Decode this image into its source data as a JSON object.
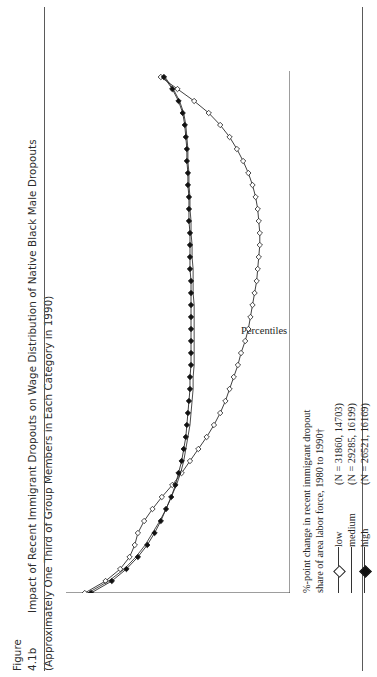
{
  "caption": {
    "figure_number": "Figure 4.1b",
    "line1": "Impact of Recent Immigrant Dropouts on Wage Distribution of Native Black Male Dropouts",
    "line2": "(Approximately One Third of Group Members in Each Category in 1990)"
  },
  "legend": {
    "header_line1": "%-point change in recent immigrant dropout",
    "header_line2": "share of area labor force, 1980 to 1990†",
    "entries": [
      {
        "label": "low",
        "n_text": "(N = 31860, 14703)",
        "marker": "open-diamond"
      },
      {
        "label": "medium",
        "n_text": "(N = 29285, 16199)",
        "marker": "line-only"
      },
      {
        "label": "high",
        "n_text": "(N = 26521, 16169)",
        "marker": "filled-diamond"
      }
    ]
  },
  "chart_data": {
    "type": "line",
    "title": "Impact of Recent Immigrant Dropouts on Wage Distribution of Native Black Male Dropouts",
    "xlabel": "Percentiles of distribution of wage residuals*",
    "ylabel": "Change in Log-Wage Residual, 1980 to 1990",
    "xlim": [
      5,
      92
    ],
    "ylim": [
      -0.15,
      0.065
    ],
    "grid": false,
    "legend_position": "below-right",
    "xticks": [
      10,
      15,
      20,
      25,
      30,
      35,
      40,
      45,
      50,
      55,
      60,
      65,
      70,
      75,
      80,
      85,
      90
    ],
    "xticklabels": [
      "10",
      "15",
      "20",
      "25",
      "30",
      "35",
      "40",
      "45",
      "50",
      "55",
      "60",
      "65",
      "70",
      "75",
      "80",
      "85",
      "90"
    ],
    "yticks": [
      0.06,
      0.04,
      0.02,
      0,
      -0.02,
      -0.04,
      -0.06,
      -0.08,
      -0.1,
      -0.12,
      -0.14
    ],
    "yticklabels": [
      "0.06",
      "0.04",
      "0.02",
      "0",
      "-0.02",
      "-0.04",
      "-0.06",
      "-0.08",
      "-0.1",
      "-0.12",
      "-0.14"
    ],
    "x": [
      5,
      7,
      9,
      11,
      13,
      15,
      17,
      19,
      21,
      23,
      25,
      27,
      29,
      31,
      33,
      35,
      37,
      39,
      41,
      43,
      45,
      47,
      49,
      51,
      53,
      55,
      57,
      59,
      61,
      63,
      65,
      67,
      69,
      71,
      73,
      75,
      77,
      79,
      81,
      83,
      85,
      87,
      89,
      91
    ],
    "series": [
      {
        "name": "low",
        "marker": "open-diamond",
        "values": [
          0.047,
          0.027,
          0.013,
          0.004,
          -0.001,
          -0.004,
          -0.01,
          -0.018,
          -0.027,
          -0.037,
          -0.046,
          -0.054,
          -0.062,
          -0.07,
          -0.077,
          -0.083,
          -0.088,
          -0.092,
          -0.096,
          -0.1,
          -0.103,
          -0.107,
          -0.11,
          -0.112,
          -0.114,
          -0.116,
          -0.118,
          -0.119,
          -0.12,
          -0.121,
          -0.121,
          -0.12,
          -0.119,
          -0.117,
          -0.114,
          -0.11,
          -0.105,
          -0.099,
          -0.092,
          -0.083,
          -0.072,
          -0.058,
          -0.042,
          -0.026
        ]
      },
      {
        "name": "medium",
        "marker": "line-only",
        "values": [
          0.044,
          0.024,
          0.009,
          -0.002,
          -0.011,
          -0.018,
          -0.025,
          -0.031,
          -0.036,
          -0.041,
          -0.045,
          -0.048,
          -0.05,
          -0.052,
          -0.054,
          -0.055,
          -0.056,
          -0.057,
          -0.057,
          -0.058,
          -0.058,
          -0.058,
          -0.058,
          -0.058,
          -0.058,
          -0.057,
          -0.057,
          -0.057,
          -0.056,
          -0.056,
          -0.055,
          -0.055,
          -0.054,
          -0.054,
          -0.053,
          -0.053,
          -0.052,
          -0.052,
          -0.051,
          -0.05,
          -0.048,
          -0.044,
          -0.038,
          -0.03
        ]
      },
      {
        "name": "high",
        "marker": "filled-diamond",
        "values": [
          0.041,
          0.021,
          0.007,
          -0.004,
          -0.013,
          -0.02,
          -0.026,
          -0.031,
          -0.036,
          -0.04,
          -0.043,
          -0.046,
          -0.048,
          -0.05,
          -0.051,
          -0.052,
          -0.053,
          -0.054,
          -0.054,
          -0.055,
          -0.055,
          -0.055,
          -0.055,
          -0.055,
          -0.055,
          -0.055,
          -0.055,
          -0.054,
          -0.054,
          -0.054,
          -0.054,
          -0.053,
          -0.053,
          -0.053,
          -0.052,
          -0.052,
          -0.051,
          -0.051,
          -0.05,
          -0.049,
          -0.047,
          -0.043,
          -0.037,
          -0.029
        ]
      }
    ]
  }
}
